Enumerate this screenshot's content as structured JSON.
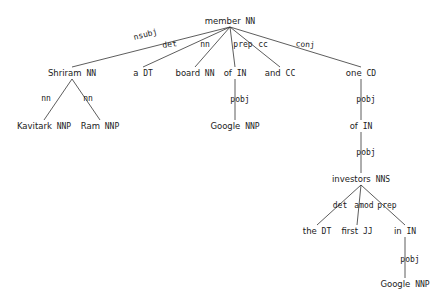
{
  "nodes": [
    {
      "id": "member",
      "word": "member",
      "tag": "NN",
      "x": 230,
      "y": 24
    },
    {
      "id": "shriram",
      "word": "Shriram",
      "tag": "NN",
      "x": 72,
      "y": 76
    },
    {
      "id": "a",
      "word": "a",
      "tag": "DT",
      "x": 143,
      "y": 76
    },
    {
      "id": "board",
      "word": "board",
      "tag": "NN",
      "x": 195,
      "y": 76
    },
    {
      "id": "of1",
      "word": "of",
      "tag": "IN",
      "x": 235,
      "y": 76
    },
    {
      "id": "and",
      "word": "and",
      "tag": "CC",
      "x": 280,
      "y": 76
    },
    {
      "id": "one",
      "word": "one",
      "tag": "CD",
      "x": 361,
      "y": 76
    },
    {
      "id": "kavitark",
      "word": "Kavitark",
      "tag": "NNP",
      "x": 44,
      "y": 129
    },
    {
      "id": "ram",
      "word": "Ram",
      "tag": "NNP",
      "x": 100,
      "y": 129
    },
    {
      "id": "google1",
      "word": "Google",
      "tag": "NNP",
      "x": 235,
      "y": 129
    },
    {
      "id": "of2",
      "word": "of",
      "tag": "IN",
      "x": 361,
      "y": 129
    },
    {
      "id": "investors",
      "word": "investors",
      "tag": "NNS",
      "x": 361,
      "y": 182
    },
    {
      "id": "the",
      "word": "the",
      "tag": "DT",
      "x": 317,
      "y": 234
    },
    {
      "id": "first",
      "word": "first",
      "tag": "JJ",
      "x": 357,
      "y": 234
    },
    {
      "id": "in",
      "word": "in",
      "tag": "IN",
      "x": 405,
      "y": 234
    },
    {
      "id": "google2",
      "word": "Google",
      "tag": "NNP",
      "x": 405,
      "y": 287
    }
  ],
  "edges": [
    {
      "from": "member",
      "to": "shriram",
      "label": "nsubj",
      "lx": 146,
      "ly": 37,
      "rot": -14
    },
    {
      "from": "member",
      "to": "a",
      "label": "det",
      "lx": 170,
      "ly": 47,
      "rot": -8
    },
    {
      "from": "member",
      "to": "board",
      "label": "nn",
      "lx": 205,
      "ly": 47,
      "rot": 0
    },
    {
      "from": "member",
      "to": "of1",
      "label": "prep",
      "lx": 243,
      "ly": 47,
      "rot": 0
    },
    {
      "from": "member",
      "to": "and",
      "label": "cc",
      "lx": 263,
      "ly": 47,
      "rot": 0
    },
    {
      "from": "member",
      "to": "one",
      "label": "conj",
      "lx": 305,
      "ly": 47,
      "rot": 4
    },
    {
      "from": "shriram",
      "to": "kavitark",
      "label": "nn",
      "lx": 46,
      "ly": 101,
      "rot": 0
    },
    {
      "from": "shriram",
      "to": "ram",
      "label": "nn",
      "lx": 88,
      "ly": 101,
      "rot": 0
    },
    {
      "from": "of1",
      "to": "google1",
      "label": "pobj",
      "lx": 240,
      "ly": 102,
      "rot": 0
    },
    {
      "from": "one",
      "to": "of2",
      "label": "pobj",
      "lx": 366,
      "ly": 102,
      "rot": 0
    },
    {
      "from": "of2",
      "to": "investors",
      "label": "pobj",
      "lx": 366,
      "ly": 155,
      "rot": 0
    },
    {
      "from": "investors",
      "to": "the",
      "label": "det",
      "lx": 340,
      "ly": 208,
      "rot": 0
    },
    {
      "from": "investors",
      "to": "first",
      "label": "amod",
      "lx": 364,
      "ly": 208,
      "rot": 0
    },
    {
      "from": "investors",
      "to": "in",
      "label": "prep",
      "lx": 387,
      "ly": 208,
      "rot": 0
    },
    {
      "from": "in",
      "to": "google2",
      "label": "pobj",
      "lx": 410,
      "ly": 262,
      "rot": 0
    }
  ]
}
